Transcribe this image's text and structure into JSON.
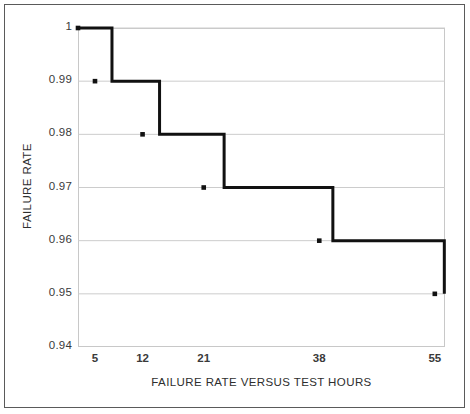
{
  "chart_data": {
    "type": "line",
    "subtype": "step",
    "title": "",
    "xlabel": "FAILURE RATE VERSUS TEST HOURS",
    "ylabel": "FAILURE RATE",
    "x": [
      5,
      12,
      21,
      38,
      55
    ],
    "xtick_labels": [
      "5",
      "12",
      "21",
      "38",
      "55"
    ],
    "xtick_values": [
      5,
      12,
      21,
      38,
      55
    ],
    "xlim": [
      2.5,
      56.5
    ],
    "ytick_labels": [
      "1",
      "0.99",
      "0.98",
      "0.97",
      "0.96",
      "0.95",
      "0.94"
    ],
    "ytick_values": [
      1,
      0.99,
      0.98,
      0.97,
      0.96,
      0.95,
      0.94
    ],
    "ylim": [
      0.94,
      1.0
    ],
    "grid": true,
    "grid_axis": "y",
    "legend": false,
    "series": [
      {
        "name": "Failure Rate",
        "values": [
          0.99,
          0.98,
          0.97,
          0.96,
          0.95
        ],
        "marker": "square",
        "marker_color": "#111111",
        "line_color": "#111111",
        "line_width": 3
      }
    ],
    "step_points": [
      {
        "x": 2.5,
        "y": 1.0
      },
      {
        "x": 7.5,
        "y": 1.0
      },
      {
        "x": 7.5,
        "y": 0.99
      },
      {
        "x": 14.5,
        "y": 0.99
      },
      {
        "x": 14.5,
        "y": 0.98
      },
      {
        "x": 24.0,
        "y": 0.98
      },
      {
        "x": 24.0,
        "y": 0.97
      },
      {
        "x": 40.0,
        "y": 0.97
      },
      {
        "x": 40.0,
        "y": 0.96
      },
      {
        "x": 56.4,
        "y": 0.96
      },
      {
        "x": 56.4,
        "y": 0.95
      }
    ],
    "markers": [
      {
        "x": 2.5,
        "y": 1.0
      },
      {
        "x": 5,
        "y": 0.99
      },
      {
        "x": 12,
        "y": 0.98
      },
      {
        "x": 21,
        "y": 0.97
      },
      {
        "x": 38,
        "y": 0.96
      },
      {
        "x": 55,
        "y": 0.95
      }
    ],
    "colors": {
      "line": "#111111",
      "grid": "#cccccc",
      "plot_border": "#c8c8c8",
      "figure_border": "#5a5a5a",
      "text": "#2e2e2e",
      "background": "#ffffff"
    }
  }
}
